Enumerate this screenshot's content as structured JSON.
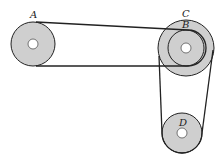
{
  "diagram": {
    "type": "belt-pulley-system",
    "colors": {
      "pulley_fill": "#cfcfcf",
      "stroke": "#222222",
      "hole": "#ffffff",
      "background": "#ffffff"
    },
    "pulleys": [
      {
        "id": "A",
        "label": "A",
        "cx": 33,
        "cy": 44,
        "r": 22,
        "hole_r": 5
      },
      {
        "id": "C",
        "label": "C",
        "cx": 186,
        "cy": 48,
        "r": 28,
        "hole_r": 5
      },
      {
        "id": "B",
        "label": "B",
        "cx": 186,
        "cy": 48,
        "r": 18,
        "hole_r": 5
      },
      {
        "id": "D",
        "label": "D",
        "cx": 182,
        "cy": 133,
        "r": 20,
        "hole_r": 5
      }
    ],
    "belts": [
      {
        "id": "belt-A-B",
        "connects": [
          "A",
          "B"
        ]
      },
      {
        "id": "belt-C-D",
        "connects": [
          "C",
          "D"
        ]
      }
    ],
    "labels": {
      "A": "A",
      "B": "B",
      "C": "C",
      "D": "D"
    }
  }
}
